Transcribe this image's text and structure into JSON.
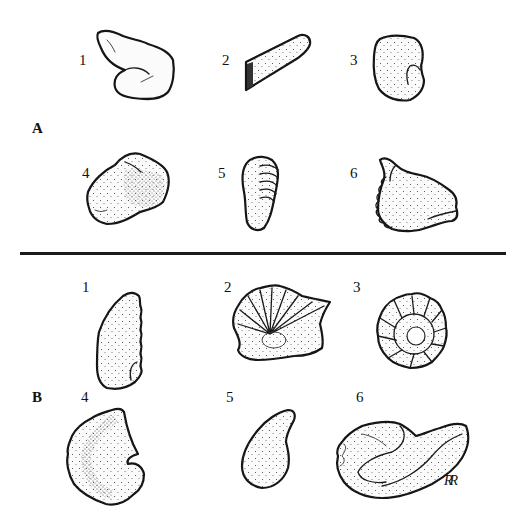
{
  "plate": {
    "divider": true,
    "sections": [
      {
        "label": "A",
        "figures": [
          {
            "number": "1",
            "description": "irregular elongate fragment with rounded lower lobe"
          },
          {
            "number": "2",
            "description": "elongate tabular fragment"
          },
          {
            "number": "3",
            "description": "rounded fragment with notch"
          },
          {
            "number": "4",
            "description": "blocky rounded fragment"
          },
          {
            "number": "5",
            "description": "small ribbed fragment"
          },
          {
            "number": "6",
            "description": "fragment with crenulated margin and projecting lobes"
          }
        ]
      },
      {
        "label": "B",
        "figures": [
          {
            "number": "1",
            "description": "ribbed shell fragment, side view"
          },
          {
            "number": "2",
            "description": "fan-shaped ribbed shell"
          },
          {
            "number": "3",
            "description": "coiled ribbed shell (ammonite-like)"
          },
          {
            "number": "4",
            "description": "coiled fragment"
          },
          {
            "number": "5",
            "description": "small bean-shaped fragment"
          },
          {
            "number": "6",
            "description": "elongate coiled fragment"
          }
        ]
      }
    ],
    "signature": "RR"
  }
}
